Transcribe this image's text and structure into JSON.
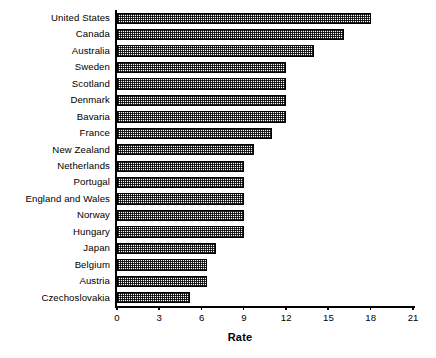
{
  "chart_data": {
    "type": "bar",
    "orientation": "horizontal",
    "title": "",
    "subtitle": "",
    "xlabel": "Rate",
    "ylabel": "",
    "xlim": [
      0,
      21
    ],
    "xticks": [
      0,
      3,
      6,
      9,
      12,
      15,
      18,
      21
    ],
    "xtick_labels": [
      "0",
      "3",
      "6",
      "9",
      "12",
      "15",
      "18",
      "21"
    ],
    "grid": false,
    "legend": null,
    "categories": [
      "United States",
      "Canada",
      "Australia",
      "Sweden",
      "Scotland",
      "Denmark",
      "Bavaria",
      "France",
      "New Zealand",
      "Netherlands",
      "Portugal",
      "England and Wales",
      "Norway",
      "Hungary",
      "Japan",
      "Belgium",
      "Austria",
      "Czechoslovakia"
    ],
    "values": [
      18.0,
      16.1,
      14.0,
      12.0,
      12.0,
      12.0,
      12.0,
      11.0,
      9.7,
      9.0,
      9.0,
      9.0,
      9.0,
      9.0,
      7.0,
      6.4,
      6.4,
      5.2
    ],
    "bar_style": {
      "fill": "crosshatch-pattern",
      "edge_color": "#000000",
      "face_color": "#ffffff"
    }
  },
  "axis": {
    "x_title": "Rate"
  }
}
